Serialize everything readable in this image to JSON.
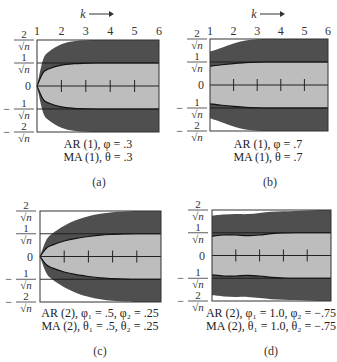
{
  "chart_data": [
    {
      "id": "a",
      "type": "area",
      "panel_label": "(a)",
      "x_axis_label": "k",
      "x_ticks": [
        "1",
        "2",
        "3",
        "4",
        "5",
        "6"
      ],
      "show_x_ticks": true,
      "xlim": [
        1,
        6
      ],
      "ylim": [
        -2,
        2
      ],
      "y_unit": "1/sqrt(n)",
      "y_ticks": [
        {
          "value": 2,
          "label_num": "2",
          "sign": ""
        },
        {
          "value": 1,
          "label_num": "1",
          "sign": ""
        },
        {
          "value": 0,
          "label_num": "0",
          "sign": ""
        },
        {
          "value": -1,
          "label_num": "1",
          "sign": "-"
        },
        {
          "value": -2,
          "label_num": "2",
          "sign": "-"
        }
      ],
      "caption_lines": [
        "AR (1), φ = .3",
        "MA (1), θ =  .3"
      ],
      "k": [
        1,
        1.25,
        1.5,
        2,
        2.5,
        3,
        3.5,
        4,
        5,
        6
      ],
      "outer_band": [
        0,
        1.15,
        1.5,
        1.82,
        1.95,
        1.99,
        2,
        2,
        2,
        2
      ],
      "inner_band": [
        0,
        0.58,
        0.75,
        0.91,
        0.97,
        0.99,
        1,
        1,
        1,
        1
      ],
      "inner_tick_k": [
        2,
        3,
        4,
        5
      ]
    },
    {
      "id": "b",
      "type": "area",
      "panel_label": "(b)",
      "x_axis_label": "k",
      "x_ticks": [
        "1",
        "2",
        "3",
        "4",
        "5",
        "6"
      ],
      "show_x_ticks": true,
      "xlim": [
        1,
        6
      ],
      "ylim": [
        -2,
        2
      ],
      "y_unit": "1/sqrt(n)",
      "y_ticks": [
        {
          "value": 2,
          "label_num": "2",
          "sign": ""
        },
        {
          "value": 1,
          "label_num": "1",
          "sign": ""
        },
        {
          "value": 0,
          "label_num": "0",
          "sign": ""
        },
        {
          "value": -1,
          "label_num": "1",
          "sign": "-"
        },
        {
          "value": -2,
          "label_num": "2",
          "sign": "-"
        }
      ],
      "caption_lines": [
        "AR (1), φ = .7",
        "MA (1), θ =  .7"
      ],
      "k": [
        1,
        1.5,
        2,
        2.5,
        3,
        3.5,
        4,
        5,
        6
      ],
      "outer_band": [
        1.45,
        1.62,
        1.8,
        1.93,
        1.99,
        2,
        2,
        2,
        2
      ],
      "inner_band": [
        0.82,
        0.88,
        0.93,
        0.97,
        0.99,
        1,
        1,
        1,
        1
      ],
      "inner_tick_k": [
        2,
        3,
        4,
        5
      ]
    },
    {
      "id": "c",
      "type": "area",
      "panel_label": "(c)",
      "x_axis_label": "",
      "x_ticks": [],
      "show_x_ticks": false,
      "xlim": [
        1,
        6
      ],
      "ylim": [
        -2,
        2
      ],
      "y_unit": "1/sqrt(n)",
      "y_ticks": [
        {
          "value": 2,
          "label_num": "2",
          "sign": ""
        },
        {
          "value": 1,
          "label_num": "1",
          "sign": ""
        },
        {
          "value": 0,
          "label_num": "0",
          "sign": ""
        },
        {
          "value": -1,
          "label_num": "1",
          "sign": "-"
        },
        {
          "value": -2,
          "label_num": "2",
          "sign": "-"
        }
      ],
      "caption_lines": [
        "AR (2), φ₁ = .5, φ₂ = .25",
        "MA (2), θ₁ = .5,  θ₂ = .25"
      ],
      "k": [
        1,
        1.25,
        1.5,
        2,
        2.5,
        3,
        3.5,
        4,
        4.5,
        5,
        6
      ],
      "outer_band": [
        0,
        0.7,
        1.0,
        1.35,
        1.6,
        1.77,
        1.88,
        1.95,
        1.98,
        2,
        2
      ],
      "inner_band": [
        0,
        0.35,
        0.5,
        0.68,
        0.8,
        0.88,
        0.94,
        0.97,
        0.99,
        1,
        1
      ],
      "inner_tick_k": [
        2,
        3,
        4,
        5
      ]
    },
    {
      "id": "d",
      "type": "area",
      "panel_label": "(d)",
      "x_axis_label": "",
      "x_ticks": [],
      "show_x_ticks": false,
      "xlim": [
        1,
        6
      ],
      "ylim": [
        -2,
        2
      ],
      "y_unit": "1/sqrt(n)",
      "y_ticks": [
        {
          "value": 2,
          "label_num": "2",
          "sign": ""
        },
        {
          "value": 1,
          "label_num": "1",
          "sign": ""
        },
        {
          "value": 0,
          "label_num": "0",
          "sign": ""
        },
        {
          "value": -1,
          "label_num": "1",
          "sign": "-"
        },
        {
          "value": -2,
          "label_num": "2",
          "sign": "-"
        }
      ],
      "caption_lines": [
        "AR (2), φ₁ = 1.0, φ₂ = −.75",
        "MA (2), θ₁ = 1.0,  θ₂ = −.75"
      ],
      "k": [
        1,
        1.5,
        2,
        2.5,
        3,
        3.5,
        4,
        4.5,
        5,
        5.5,
        6
      ],
      "outer_band": [
        1.75,
        1.8,
        1.82,
        1.82,
        1.87,
        1.92,
        1.94,
        1.96,
        1.98,
        2,
        2
      ],
      "inner_band": [
        0.85,
        0.9,
        0.9,
        0.87,
        0.9,
        0.96,
        0.99,
        1,
        1,
        1,
        1
      ],
      "inner_tick_k": [
        2,
        3,
        4,
        5
      ]
    }
  ],
  "colors": {
    "dark_band": "#4f4f4f",
    "light_band": "#bdbdbd",
    "frame": "#333333",
    "background": "#ffffff"
  }
}
